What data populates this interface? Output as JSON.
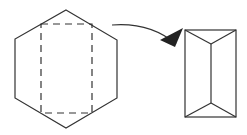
{
  "diagram": {
    "colors": {
      "stroke": "#333333",
      "background": "#ffffff"
    },
    "hexagon": {
      "points": "66,10 117,40 117,98 66,128 15,98 15,39"
    },
    "dashed_rect": {
      "x": 41,
      "y": 24,
      "width": 51,
      "height": 89
    },
    "arrow": {
      "path": "M112,25 Q150,22 176,44",
      "head": "183,28 175,47 160,40"
    },
    "box": {
      "x": 185,
      "y": 30,
      "width": 51,
      "height": 87,
      "inner_top": "211,44",
      "inner_bottom": "211,103"
    }
  }
}
